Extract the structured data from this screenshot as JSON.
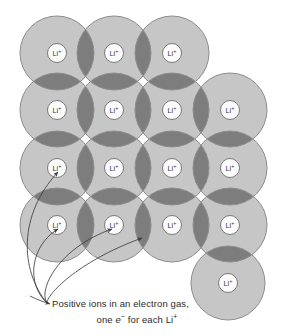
{
  "figure": {
    "background_color": "#ffffff"
  },
  "colors": {
    "sphere_fill": "#c6c6c6",
    "sphere_overlap_fill": "#7d7d7d",
    "sphere_stroke": "#8d8d8d",
    "ion_core_fill": "#fbfbfb",
    "ion_core_stroke": "#6e6e6e",
    "label_text": "#3a3a3a",
    "arrow_color": "#3d3d3d",
    "caption_text": "#2b2b2b"
  },
  "lattice": {
    "radius": 37,
    "core_radius": 9.5,
    "ion_label": "Li",
    "ion_charge": "+",
    "ion_label_full": "Li⁺",
    "spheres": [
      {
        "id": "sphere-r1c1",
        "cx": 57,
        "cy": 53,
        "label": "Li⁺"
      },
      {
        "id": "sphere-r1c2",
        "cx": 114,
        "cy": 53,
        "label": "Li⁺"
      },
      {
        "id": "sphere-r1c3",
        "cx": 172,
        "cy": 53,
        "label": "Li⁺"
      },
      {
        "id": "sphere-r2c1",
        "cx": 57,
        "cy": 110,
        "label": "Li⁺"
      },
      {
        "id": "sphere-r2c2",
        "cx": 114,
        "cy": 110,
        "label": "Li⁺"
      },
      {
        "id": "sphere-r2c3",
        "cx": 172,
        "cy": 110,
        "label": "Li⁺"
      },
      {
        "id": "sphere-r2c4",
        "cx": 230,
        "cy": 110,
        "label": "Li⁺"
      },
      {
        "id": "sphere-r3c1",
        "cx": 57,
        "cy": 168,
        "label": "Li⁺"
      },
      {
        "id": "sphere-r3c2",
        "cx": 114,
        "cy": 168,
        "label": "Li⁺"
      },
      {
        "id": "sphere-r3c3",
        "cx": 172,
        "cy": 168,
        "label": "Li⁺"
      },
      {
        "id": "sphere-r3c4",
        "cx": 230,
        "cy": 168,
        "label": "Li⁺"
      },
      {
        "id": "sphere-r4c1",
        "cx": 57,
        "cy": 225,
        "label": "Li⁺"
      },
      {
        "id": "sphere-r4c2",
        "cx": 114,
        "cy": 225,
        "label": "Li⁺"
      },
      {
        "id": "sphere-r4c3",
        "cx": 172,
        "cy": 225,
        "label": "Li⁺"
      },
      {
        "id": "sphere-r4c4",
        "cx": 230,
        "cy": 225,
        "label": "Li⁺"
      },
      {
        "id": "sphere-outlier",
        "cx": 228,
        "cy": 283,
        "label": "Li⁺"
      }
    ]
  },
  "annotations": {
    "arrows": [
      {
        "id": "arrow-to-r3c1",
        "path": "M 47 303 C 20 270 18 215 58 172",
        "target": "sphere-r3c1"
      },
      {
        "id": "arrow-to-r4c1",
        "path": "M 47 303 C 26 284 30 246 58 229",
        "target": "sphere-r4c1"
      },
      {
        "id": "arrow-to-r4c2",
        "path": "M 47 303 C 38 290 58 248 112 229",
        "target": "sphere-r4c2"
      },
      {
        "id": "arrow-to-overlap",
        "path": "M 47 303 C 46 296 76 262 142 238",
        "target": "overlap-region"
      }
    ],
    "caption_arrow": {
      "id": "arrow-to-caption",
      "path": "M 30 296 C 38 300 44 302 50 304"
    },
    "caption": {
      "line1": "Positive ions in an electron gas,",
      "line2_prefix": "one ",
      "line2_em": "e",
      "line2_em_sup": "−",
      "line2_middle": " for each Li",
      "line2_sup": "+",
      "line2_full": "one e⁻ for each Li⁺",
      "full_text": "Positive ions in an electron gas, one e⁻ for each Li⁺"
    }
  }
}
